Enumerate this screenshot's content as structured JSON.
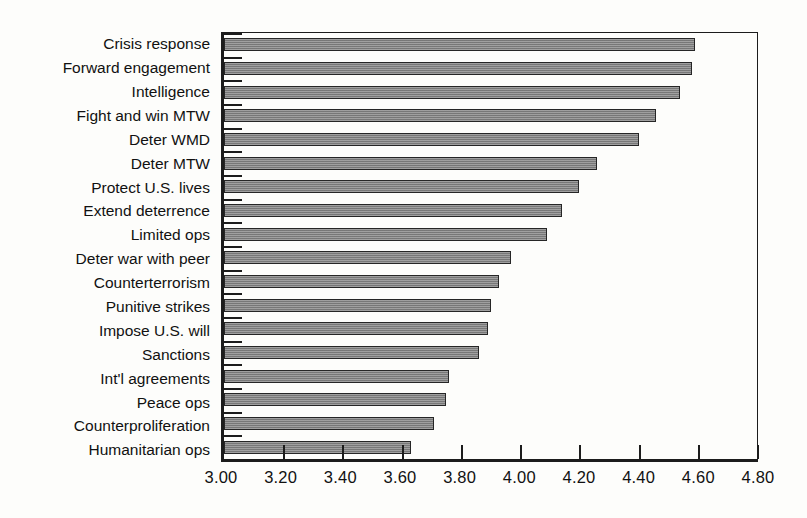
{
  "chart_data": {
    "type": "bar",
    "orientation": "horizontal",
    "title": "",
    "subtitle": "",
    "xlabel": "",
    "ylabel": "",
    "xlim": [
      3.0,
      4.8
    ],
    "xticks": [
      "3.00",
      "3.20",
      "3.40",
      "3.60",
      "3.80",
      "4.00",
      "4.20",
      "4.40",
      "4.60",
      "4.80"
    ],
    "xtick_values": [
      3.0,
      3.2,
      3.4,
      3.6,
      3.8,
      4.0,
      4.2,
      4.4,
      4.6,
      4.8
    ],
    "grid": false,
    "legend": false,
    "legend_position": "none",
    "bar_color": "#858585",
    "bar_edge_color": "#262626",
    "axis_color": "#1c1c1c",
    "background_color": "#fdfdfb",
    "categories": [
      "Crisis response",
      "Forward engagement",
      "Intelligence",
      "Fight and win MTW",
      "Deter WMD",
      "Deter MTW",
      "Protect U.S. lives",
      "Extend deterrence",
      "Limited ops",
      "Deter war with peer",
      "Counterterrorism",
      "Punitive strikes",
      "Impose U.S. will",
      "Sanctions",
      "Int'l agreements",
      "Peace ops",
      "Counterproliferation",
      "Humanitarian ops"
    ],
    "values": [
      4.59,
      4.58,
      4.54,
      4.46,
      4.4,
      4.26,
      4.2,
      4.14,
      4.09,
      3.97,
      3.93,
      3.9,
      3.89,
      3.86,
      3.76,
      3.75,
      3.71,
      3.63
    ]
  }
}
